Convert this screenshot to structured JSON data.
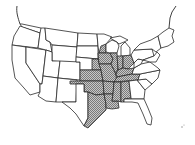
{
  "map": {
    "title": "",
    "region": "Contiguous United States",
    "style": "black outline, stippled gray shading",
    "colors": {
      "background": "#ffffff",
      "outline": "#2a2a2a",
      "shade": "#8a8a8a",
      "shade_light": "#c8c8c8"
    },
    "shaded_states": [
      "Iowa",
      "Missouri",
      "Arkansas",
      "Louisiana",
      "Oklahoma",
      "Kansas",
      "Illinois",
      "Indiana",
      "Ohio",
      "Kentucky",
      "Tennessee",
      "Mississippi",
      "Alabama",
      "Texas (east)",
      "Nebraska (east)",
      "Minnesota (south-east)"
    ],
    "unshaded_states_note": "Western states, Northeast, Great Lakes north, Georgia, Carolinas, Florida"
  }
}
